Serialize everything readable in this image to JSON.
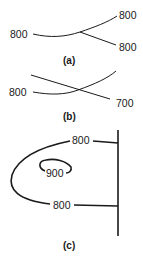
{
  "panels": [
    {
      "id": "a",
      "caption": "(a)",
      "labels": {
        "left": "800",
        "upper_right": "800",
        "lower_right": "800"
      }
    },
    {
      "id": "b",
      "caption": "(b)",
      "labels": {
        "left": "800",
        "lower_right": "700"
      }
    },
    {
      "id": "c",
      "caption": "(c)",
      "labels": {
        "top": "800",
        "inner": "900",
        "bottom": "800"
      }
    }
  ],
  "colors": {
    "line": "#1a1a1a",
    "background": "#ffffff"
  }
}
